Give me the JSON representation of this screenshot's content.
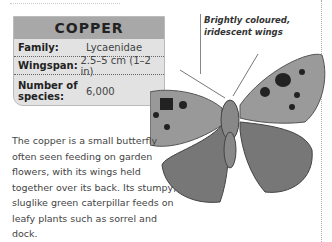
{
  "factbox": {
    "title": "COPPER",
    "rows": [
      {
        "key": "Family:",
        "value": "Lycaenidae"
      },
      {
        "key": "Wingspan:",
        "value": "2.5–5 cm (1–2 in)"
      },
      {
        "key": "Number of species:",
        "value": "6,000"
      }
    ]
  },
  "annotation": {
    "line1": "Brightly coloured,",
    "line2": "iridescent wings"
  },
  "description": "The copper is a small butterfly often seen feeding on garden flowers, with its wings held together over its back. Its stumpy, sluglike green caterpillar feeds on leafy plants such as sorrel and dock."
}
